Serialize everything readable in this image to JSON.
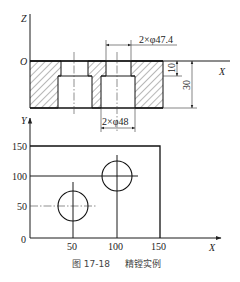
{
  "section_view": {
    "axes": {
      "vertical": "Z",
      "horizontal": "X",
      "origin": "O"
    },
    "dimensions": {
      "small_bore": "2×φ47.4",
      "large_bore": "2×φ48",
      "shallow_depth": "10",
      "total_depth": "30"
    }
  },
  "plan_view": {
    "axes": {
      "vertical": "Y",
      "horizontal": "X"
    },
    "y_ticks": [
      "150",
      "100",
      "50",
      "0"
    ],
    "x_ticks": [
      "50",
      "100",
      "150"
    ],
    "holes": [
      {
        "x": 50,
        "y": 50
      },
      {
        "x": 100,
        "y": 100
      }
    ],
    "part_extent": {
      "width": 150,
      "height": 150
    }
  },
  "caption": {
    "figure_number": "图 17-18",
    "title": "精镗实例"
  }
}
